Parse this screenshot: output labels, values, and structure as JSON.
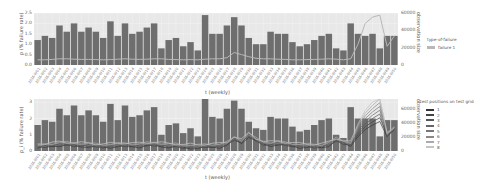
{
  "chart_data": [
    {
      "type": "bar",
      "title": "",
      "xlabel": "t (weekly)",
      "ylabel": "p (% failure rate)",
      "ylabel_right": "observation size",
      "ylim": [
        0,
        2.5
      ],
      "ylim_right": [
        0,
        60000
      ],
      "yticks": [
        "0.0",
        "0.5",
        "1.0",
        "1.5",
        "2.0",
        "2.5"
      ],
      "yticks_right": [
        "0",
        "20000",
        "40000",
        "60000"
      ],
      "grid": true,
      "legend_position": "right",
      "legend": {
        "title": "type-of-failure",
        "entries": [
          "failure 1"
        ]
      },
      "bars_label": "observation size (% failure rate bars)",
      "values": [
        1.2,
        1.4,
        1.3,
        1.9,
        1.6,
        2.0,
        1.6,
        1.8,
        1.6,
        1.3,
        2.1,
        1.4,
        2.0,
        1.5,
        1.6,
        1.8,
        2.0,
        0.8,
        1.2,
        1.3,
        0.9,
        1.1,
        0.7,
        2.4,
        1.5,
        1.5,
        1.9,
        2.3,
        1.9,
        1.3,
        1.0,
        1.0,
        1.6,
        1.5,
        1.5,
        1.1,
        0.9,
        1.0,
        1.2,
        1.4,
        1.5,
        0.8,
        0.7,
        2.0,
        1.5,
        1.4,
        1.5,
        0.8,
        1.4,
        1.4
      ],
      "series": [
        {
          "name": "failure 1",
          "color": "#b8b8b8",
          "values": [
            0.25,
            0.25,
            0.27,
            0.3,
            0.3,
            0.28,
            0.27,
            0.27,
            0.26,
            0.25,
            0.26,
            0.28,
            0.3,
            0.28,
            0.27,
            0.28,
            0.3,
            0.3,
            0.27,
            0.26,
            0.25,
            0.26,
            0.25,
            0.28,
            0.3,
            0.3,
            0.35,
            0.6,
            0.5,
            0.4,
            0.32,
            0.3,
            0.3,
            0.28,
            0.27,
            0.25,
            0.25,
            0.26,
            0.27,
            0.28,
            0.3,
            0.28,
            0.25,
            0.3,
            1.0,
            2.0,
            2.3,
            2.4,
            0.9,
            1.4
          ]
        }
      ]
    },
    {
      "type": "bar",
      "title": "",
      "xlabel": "t (weekly)",
      "ylabel": "p_i (% failure rate)",
      "ylabel_right": "observation size",
      "ylim": [
        0,
        3.2
      ],
      "ylim_right": [
        0,
        75000
      ],
      "yticks": [
        "0",
        "1",
        "2",
        "3"
      ],
      "yticks_right": [
        "0",
        "20000",
        "40000",
        "60000"
      ],
      "grid": true,
      "legend_position": "right",
      "legend": {
        "title": "test positions on test grid",
        "entries": [
          "1",
          "2",
          "3",
          "4",
          "5",
          "6",
          "7",
          "8"
        ]
      },
      "values": [
        1.6,
        1.9,
        1.8,
        2.6,
        2.2,
        2.8,
        2.2,
        2.5,
        2.2,
        1.8,
        2.9,
        1.9,
        2.8,
        2.1,
        2.2,
        2.5,
        2.7,
        1.0,
        1.6,
        1.7,
        1.1,
        1.4,
        0.9,
        3.3,
        2.1,
        2.0,
        2.6,
        3.1,
        2.6,
        1.8,
        1.4,
        1.3,
        2.1,
        2.0,
        2.0,
        1.5,
        1.2,
        1.3,
        1.6,
        1.9,
        2.0,
        1.0,
        0.8,
        2.7,
        2.0,
        2.0,
        2.0,
        0.9,
        1.9,
        1.9
      ],
      "series": [
        {
          "name": "1",
          "color": "#333333"
        },
        {
          "name": "2",
          "color": "#444444"
        },
        {
          "name": "3",
          "color": "#555555"
        },
        {
          "name": "4",
          "color": "#666666"
        },
        {
          "name": "5",
          "color": "#777777"
        },
        {
          "name": "6",
          "color": "#888888"
        },
        {
          "name": "7",
          "color": "#aaaaaa"
        },
        {
          "name": "8",
          "color": "#c4c4c4"
        }
      ],
      "line_base": [
        0.3,
        0.35,
        0.4,
        0.45,
        0.45,
        0.42,
        0.4,
        0.38,
        0.35,
        0.33,
        0.35,
        0.38,
        0.4,
        0.38,
        0.37,
        0.42,
        0.45,
        0.4,
        0.35,
        0.35,
        0.3,
        0.3,
        0.28,
        0.33,
        0.35,
        0.35,
        0.45,
        0.8,
        0.6,
        1.0,
        0.7,
        0.5,
        0.45,
        0.5,
        0.45,
        0.4,
        0.35,
        0.33,
        0.32,
        0.33,
        0.45,
        0.7,
        0.55,
        0.45,
        1.6,
        2.4,
        2.9,
        3.3,
        1.0,
        1.4
      ]
    }
  ],
  "x_ticks": [
    "2016-W01",
    "2016-W02",
    "2016-W03",
    "2016-W04",
    "2016-W05",
    "2016-W06",
    "2016-W07",
    "2016-W08",
    "2016-W09",
    "2016-W10",
    "2016-W11",
    "2016-W12",
    "2016-W13",
    "2016-W14",
    "2016-W15",
    "2016-W16",
    "2016-W17",
    "2016-W18",
    "2016-W19",
    "2016-W20",
    "2016-W21",
    "2016-W22",
    "2016-W23",
    "2016-W24",
    "2016-W25",
    "2016-W26",
    "2016-W27",
    "2016-W28",
    "2016-W29",
    "2016-W30",
    "2016-W31",
    "2016-W32",
    "2016-W33",
    "2016-W34",
    "2016-W35",
    "2016-W36",
    "2016-W37",
    "2016-W38",
    "2016-W39",
    "2016-W40",
    "2016-W41",
    "2016-W42",
    "2016-W43",
    "2016-W44",
    "2016-W45",
    "2016-W46",
    "2016-W47",
    "2016-W48",
    "2016-W49",
    "2016-W50"
  ],
  "colors": {
    "bar": "#6e6e6e",
    "bar_edge": "#e8e8e8",
    "plot_bg": "#e8e8e8",
    "grid": "#f4f4f4"
  }
}
